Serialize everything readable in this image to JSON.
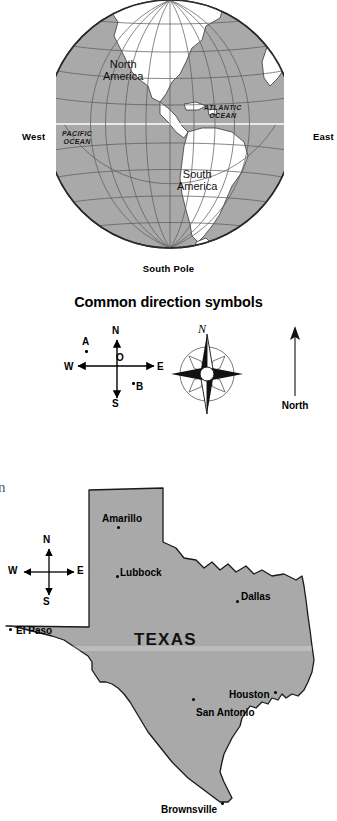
{
  "globe": {
    "name": "Western hemisphere globe",
    "labels": {
      "west": "West",
      "east": "East",
      "south_pole": "South Pole",
      "north_america": "North\nAmerica",
      "north_america_line1": "North",
      "north_america_line2": "America",
      "south_america_line1": "South",
      "south_america_line2": "America",
      "pacific_line1": "PACIFIC",
      "pacific_line2": "OCEAN",
      "atlantic_line1": "ATLANTIC",
      "atlantic_line2": "OCEAN"
    },
    "colors": {
      "ocean_fill": "#a9a9a9",
      "land_fill": "#ffffff",
      "graticule": "#5a5a5a",
      "outline": "#2b2b2b"
    }
  },
  "direction_symbols": {
    "title": "Common direction symbols",
    "cross_symbol": {
      "north": "N",
      "south": "S",
      "west": "W",
      "east": "E",
      "origin": "O",
      "point_a": "A",
      "point_b": "B"
    },
    "compass_rose": {
      "north": "N"
    },
    "north_arrow": {
      "label": "North"
    }
  },
  "texas_map": {
    "state_label": "TEXAS",
    "stray_glyph": "n",
    "compass": {
      "north": "N",
      "south": "S",
      "west": "W",
      "east": "E"
    },
    "cities": [
      {
        "name": "Amarillo"
      },
      {
        "name": "Lubbock"
      },
      {
        "name": "Dallas"
      },
      {
        "name": "El Paso"
      },
      {
        "name": "Houston"
      },
      {
        "name": "San Antonio"
      },
      {
        "name": "Brownsville"
      }
    ],
    "colors": {
      "state_fill": "#a9a9a9",
      "state_stroke": "#1a1a1a"
    }
  }
}
